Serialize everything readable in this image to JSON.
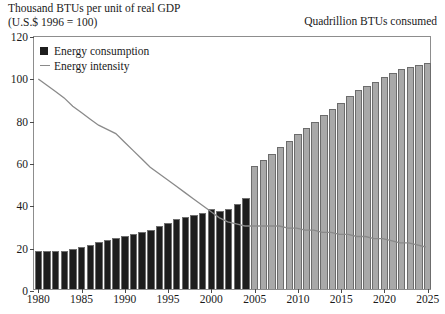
{
  "header": {
    "left_title": "Thousand BTUs per unit of real GDP\n(U.S.$ 1996 = 100)",
    "right_title": "Quadrillion BTUs consumed"
  },
  "legend": {
    "items": [
      {
        "label": "Energy consumption",
        "marker": "filled-square",
        "color": "#1d1d1d"
      },
      {
        "label": "Energy intensity",
        "marker": "line",
        "color": "#8a8a8a"
      }
    ]
  },
  "axes": {
    "y_ticks": [
      "0",
      "20",
      "40",
      "60",
      "80",
      "100",
      "120"
    ],
    "x_ticks": [
      "1980",
      "1985",
      "1990",
      "1995",
      "2000",
      "2005",
      "2010",
      "2015",
      "2020",
      "2025"
    ]
  },
  "chart_data": {
    "type": "bar",
    "title": "",
    "subtitle": "",
    "xlabel": "",
    "ylabel": "Thousand BTUs per unit of real GDP (U.S.$ 1996 = 100)",
    "ylabel_right": "Quadrillion BTUs consumed",
    "ylim": [
      0,
      120
    ],
    "xlim": [
      1980,
      2025
    ],
    "grid": false,
    "legend_position": "top-left inside plot",
    "historical_projection_split_year": 2004,
    "x": [
      1980,
      1981,
      1982,
      1983,
      1984,
      1985,
      1986,
      1987,
      1988,
      1989,
      1990,
      1991,
      1992,
      1993,
      1994,
      1995,
      1996,
      1997,
      1998,
      1999,
      2000,
      2001,
      2002,
      2003,
      2004,
      2005,
      2006,
      2007,
      2008,
      2009,
      2010,
      2011,
      2012,
      2013,
      2014,
      2015,
      2016,
      2017,
      2018,
      2019,
      2020,
      2021,
      2022,
      2023,
      2024,
      2025
    ],
    "series": [
      {
        "name": "Energy consumption",
        "type": "bar",
        "unit": "Quadrillion BTUs",
        "color_historical": "#1d1d1d",
        "color_projection": "#a9a9a9",
        "values": [
          18,
          18,
          18,
          18,
          19,
          20,
          21,
          22,
          23,
          24,
          25,
          26,
          27,
          28,
          30,
          31,
          33,
          34,
          35,
          36,
          38,
          37,
          38,
          40,
          43,
          58,
          61,
          64,
          67,
          70,
          73,
          76,
          79,
          82,
          85,
          88,
          91,
          94,
          96,
          98,
          100,
          102,
          104,
          105,
          106,
          107
        ]
      },
      {
        "name": "Energy intensity",
        "type": "line",
        "unit": "Thousand BTUs per unit of real GDP (1996 = 100)",
        "color": "#8a8a8a",
        "values": [
          100,
          97,
          94,
          91,
          87,
          84,
          81,
          78,
          76,
          74,
          70,
          66,
          62,
          58,
          55,
          52,
          49,
          46,
          43,
          40,
          37,
          34,
          32,
          31,
          30,
          30,
          30,
          30,
          30,
          29,
          29,
          28,
          28,
          27,
          27,
          26,
          26,
          25,
          25,
          24,
          24,
          23,
          22,
          22,
          21,
          20
        ]
      }
    ]
  }
}
